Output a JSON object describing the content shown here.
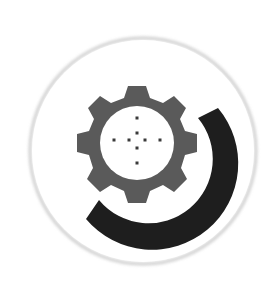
{
  "icon": {
    "name": "gear-with-arc-logo",
    "background_color": "#ffffff",
    "badge": {
      "shape": "circle",
      "fill": "#ffffff",
      "border_color": "#d6d6d6"
    },
    "gear": {
      "teeth": 9,
      "fill": "#5a5a5a",
      "center_fill": "#ffffff",
      "dots_color": "#3a3a3a",
      "dots_pattern": "crosshair"
    },
    "arc": {
      "fill": "#1e1e1e"
    }
  }
}
